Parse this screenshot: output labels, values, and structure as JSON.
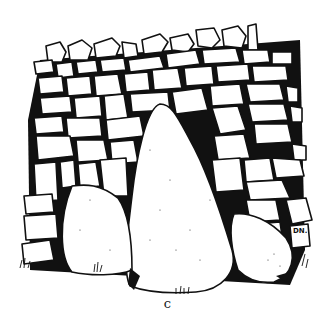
{
  "figure": {
    "caption": "c",
    "initials": "DN."
  }
}
